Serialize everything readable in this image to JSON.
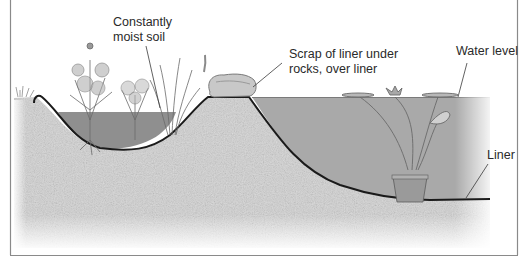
{
  "diagram": {
    "type": "pond cross-section illustration",
    "labels": {
      "moist_soil_line1": "Constantly",
      "moist_soil_line2": "moist soil",
      "scrap_line1": "Scrap of liner under",
      "scrap_line2": "rocks, over liner",
      "water_level": "Water level",
      "liner": "Liner"
    },
    "colors": {
      "water": "#a9a9a9",
      "soil": "#d6d6d6",
      "bog_water": "#8f8f8f",
      "liner": "#1a1a1a",
      "frame": "#8a8a8a",
      "text": "#2a2a2a"
    }
  }
}
